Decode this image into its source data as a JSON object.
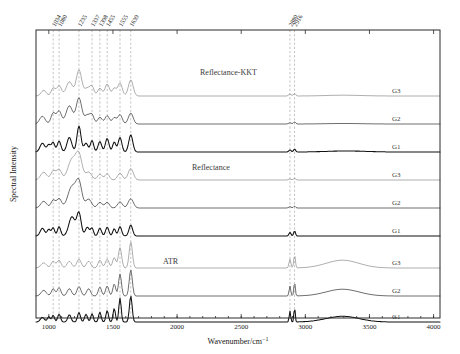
{
  "figure": {
    "width": 460,
    "height": 354,
    "background": "#ffffff"
  },
  "axes": {
    "x_title": "Wavenumber/cm",
    "x_title_exponent": "−1",
    "y_title": "Spectral Intensity",
    "x_ticks": [
      "1000",
      "1500",
      "2000",
      "2500",
      "3000",
      "3500",
      "4000"
    ],
    "x_min": 900,
    "x_max": 4050
  },
  "marker_lines": {
    "fingerprint": [
      "1034",
      "1080",
      "1235",
      "1337",
      "1398",
      "1455",
      "1555",
      "1639"
    ],
    "ch_stretch": [
      "2880",
      "2916"
    ]
  },
  "group_labels": [
    {
      "name": "Reflectance-KKT",
      "x": 200,
      "y": 75
    },
    {
      "name": "Reflectance",
      "x": 192,
      "y": 170
    },
    {
      "name": "ATR",
      "x": 163,
      "y": 264
    }
  ],
  "series_labels": [
    "G3",
    "G2",
    "G1",
    "G3",
    "G2",
    "G1",
    "G3",
    "G2",
    "G1"
  ],
  "colors": {
    "light": "#9b9b9b",
    "mid": "#5a5a5a",
    "dark": "#1a1a1a",
    "gridline": "#9a9a9a",
    "frame": "#2b2b2b"
  },
  "chart_data": {
    "type": "line",
    "title": "",
    "xlabel": "Wavenumber/cm−1",
    "ylabel": "Spectral Intensity",
    "xlim": [
      900,
      4050
    ],
    "grid": false,
    "legend": "inline-right",
    "annotations": [
      "1034",
      "1080",
      "1235",
      "1337",
      "1398",
      "1455",
      "1555",
      "1639",
      "2880",
      "2916"
    ],
    "groups": [
      {
        "name": "Reflectance-KKT",
        "series": [
          {
            "name": "G3",
            "color": "#9b9b9b",
            "baseline": 96,
            "amplitude": 1.0,
            "peaks": [
              {
                "x": 960,
                "h": 0.22,
                "w": 28
              },
              {
                "x": 1034,
                "h": 0.3,
                "w": 22
              },
              {
                "x": 1080,
                "h": 0.4,
                "w": 26
              },
              {
                "x": 1160,
                "h": 0.55,
                "w": 34
              },
              {
                "x": 1235,
                "h": 1.0,
                "w": 30
              },
              {
                "x": 1300,
                "h": 0.3,
                "w": 30
              },
              {
                "x": 1337,
                "h": 0.34,
                "w": 22
              },
              {
                "x": 1398,
                "h": 0.3,
                "w": 24
              },
              {
                "x": 1455,
                "h": 0.46,
                "w": 24
              },
              {
                "x": 1510,
                "h": 0.3,
                "w": 22
              },
              {
                "x": 1555,
                "h": 0.5,
                "w": 24
              },
              {
                "x": 1639,
                "h": 0.62,
                "w": 26
              },
              {
                "x": 2880,
                "h": 0.07,
                "w": 14
              },
              {
                "x": 2916,
                "h": 0.1,
                "w": 12
              },
              {
                "x": 3300,
                "h": 0.03,
                "w": 200
              }
            ]
          },
          {
            "name": "G2",
            "color": "#4a4a4a",
            "baseline": 124,
            "amplitude": 1.0,
            "peaks": [
              {
                "x": 950,
                "h": 0.3,
                "w": 30
              },
              {
                "x": 1034,
                "h": 0.42,
                "w": 24
              },
              {
                "x": 1080,
                "h": 0.5,
                "w": 26
              },
              {
                "x": 1160,
                "h": 0.7,
                "w": 36
              },
              {
                "x": 1235,
                "h": 1.0,
                "w": 30
              },
              {
                "x": 1300,
                "h": 0.34,
                "w": 30
              },
              {
                "x": 1337,
                "h": 0.32,
                "w": 22
              },
              {
                "x": 1398,
                "h": 0.26,
                "w": 24
              },
              {
                "x": 1455,
                "h": 0.32,
                "w": 24
              },
              {
                "x": 1510,
                "h": 0.24,
                "w": 22
              },
              {
                "x": 1555,
                "h": 0.36,
                "w": 24
              },
              {
                "x": 1639,
                "h": 0.42,
                "w": 26
              },
              {
                "x": 2880,
                "h": 0.05,
                "w": 14
              },
              {
                "x": 2916,
                "h": 0.08,
                "w": 12
              },
              {
                "x": 3300,
                "h": 0.02,
                "w": 200
              }
            ]
          },
          {
            "name": "G1",
            "color": "#111111",
            "baseline": 152,
            "amplitude": 1.0,
            "peaks": [
              {
                "x": 950,
                "h": 0.34,
                "w": 26
              },
              {
                "x": 1000,
                "h": 0.28,
                "w": 20
              },
              {
                "x": 1034,
                "h": 0.36,
                "w": 18
              },
              {
                "x": 1080,
                "h": 0.42,
                "w": 20
              },
              {
                "x": 1160,
                "h": 0.56,
                "w": 26
              },
              {
                "x": 1235,
                "h": 1.0,
                "w": 22
              },
              {
                "x": 1290,
                "h": 0.34,
                "w": 22
              },
              {
                "x": 1337,
                "h": 0.44,
                "w": 18
              },
              {
                "x": 1398,
                "h": 0.4,
                "w": 20
              },
              {
                "x": 1455,
                "h": 0.52,
                "w": 20
              },
              {
                "x": 1510,
                "h": 0.38,
                "w": 18
              },
              {
                "x": 1555,
                "h": 0.56,
                "w": 20
              },
              {
                "x": 1639,
                "h": 0.66,
                "w": 22
              },
              {
                "x": 2880,
                "h": 0.08,
                "w": 12
              },
              {
                "x": 2916,
                "h": 0.11,
                "w": 11
              },
              {
                "x": 3320,
                "h": 0.04,
                "w": 220
              }
            ]
          }
        ]
      },
      {
        "name": "Reflectance",
        "series": [
          {
            "name": "G3",
            "color": "#9b9b9b",
            "baseline": 180,
            "amplitude": 1.0,
            "peaks": [
              {
                "x": 960,
                "h": 0.3,
                "w": 34
              },
              {
                "x": 1034,
                "h": 0.34,
                "w": 26
              },
              {
                "x": 1080,
                "h": 0.4,
                "w": 28
              },
              {
                "x": 1180,
                "h": 0.78,
                "w": 44
              },
              {
                "x": 1235,
                "h": 0.92,
                "w": 34
              },
              {
                "x": 1310,
                "h": 0.3,
                "w": 34
              },
              {
                "x": 1398,
                "h": 0.22,
                "w": 26
              },
              {
                "x": 1455,
                "h": 0.24,
                "w": 24
              },
              {
                "x": 1555,
                "h": 0.26,
                "w": 26
              },
              {
                "x": 1639,
                "h": 0.44,
                "w": 28
              },
              {
                "x": 2880,
                "h": 0.04,
                "w": 14
              },
              {
                "x": 2916,
                "h": 0.06,
                "w": 12
              }
            ]
          },
          {
            "name": "G2",
            "color": "#4a4a4a",
            "baseline": 208,
            "amplitude": 1.0,
            "peaks": [
              {
                "x": 960,
                "h": 0.26,
                "w": 32
              },
              {
                "x": 1034,
                "h": 0.3,
                "w": 24
              },
              {
                "x": 1080,
                "h": 0.36,
                "w": 26
              },
              {
                "x": 1180,
                "h": 0.82,
                "w": 44
              },
              {
                "x": 1235,
                "h": 0.94,
                "w": 32
              },
              {
                "x": 1310,
                "h": 0.34,
                "w": 32
              },
              {
                "x": 1398,
                "h": 0.22,
                "w": 26
              },
              {
                "x": 1455,
                "h": 0.22,
                "w": 24
              },
              {
                "x": 1555,
                "h": 0.24,
                "w": 26
              },
              {
                "x": 1639,
                "h": 0.36,
                "w": 28
              },
              {
                "x": 2880,
                "h": 0.05,
                "w": 13
              },
              {
                "x": 2916,
                "h": 0.07,
                "w": 11
              }
            ]
          },
          {
            "name": "G1",
            "color": "#111111",
            "baseline": 236,
            "amplitude": 1.0,
            "peaks": [
              {
                "x": 950,
                "h": 0.3,
                "w": 24
              },
              {
                "x": 1000,
                "h": 0.26,
                "w": 18
              },
              {
                "x": 1034,
                "h": 0.32,
                "w": 16
              },
              {
                "x": 1080,
                "h": 0.36,
                "w": 18
              },
              {
                "x": 1180,
                "h": 0.74,
                "w": 34
              },
              {
                "x": 1235,
                "h": 0.88,
                "w": 24
              },
              {
                "x": 1300,
                "h": 0.34,
                "w": 22
              },
              {
                "x": 1337,
                "h": 0.3,
                "w": 16
              },
              {
                "x": 1398,
                "h": 0.3,
                "w": 18
              },
              {
                "x": 1455,
                "h": 0.34,
                "w": 18
              },
              {
                "x": 1510,
                "h": 0.28,
                "w": 16
              },
              {
                "x": 1555,
                "h": 0.36,
                "w": 18
              },
              {
                "x": 1639,
                "h": 0.42,
                "w": 20
              },
              {
                "x": 2880,
                "h": 0.14,
                "w": 11
              },
              {
                "x": 2916,
                "h": 0.2,
                "w": 10
              }
            ]
          }
        ]
      },
      {
        "name": "ATR",
        "series": [
          {
            "name": "G3",
            "color": "#9b9b9b",
            "baseline": 268,
            "amplitude": 1.0,
            "peaks": [
              {
                "x": 960,
                "h": 0.2,
                "w": 30
              },
              {
                "x": 1034,
                "h": 0.26,
                "w": 22
              },
              {
                "x": 1080,
                "h": 0.3,
                "w": 22
              },
              {
                "x": 1160,
                "h": 0.26,
                "w": 26
              },
              {
                "x": 1235,
                "h": 0.34,
                "w": 24
              },
              {
                "x": 1310,
                "h": 0.26,
                "w": 24
              },
              {
                "x": 1398,
                "h": 0.3,
                "w": 20
              },
              {
                "x": 1455,
                "h": 0.34,
                "w": 20
              },
              {
                "x": 1510,
                "h": 0.4,
                "w": 18
              },
              {
                "x": 1555,
                "h": 0.78,
                "w": 18
              },
              {
                "x": 1639,
                "h": 1.0,
                "w": 18
              },
              {
                "x": 2880,
                "h": 0.34,
                "w": 10
              },
              {
                "x": 2916,
                "h": 0.5,
                "w": 9
              },
              {
                "x": 3290,
                "h": 0.3,
                "w": 180
              }
            ]
          },
          {
            "name": "G2",
            "color": "#4a4a4a",
            "baseline": 296,
            "amplitude": 1.0,
            "peaks": [
              {
                "x": 960,
                "h": 0.22,
                "w": 28
              },
              {
                "x": 1034,
                "h": 0.28,
                "w": 20
              },
              {
                "x": 1080,
                "h": 0.32,
                "w": 20
              },
              {
                "x": 1160,
                "h": 0.28,
                "w": 24
              },
              {
                "x": 1235,
                "h": 0.36,
                "w": 22
              },
              {
                "x": 1310,
                "h": 0.28,
                "w": 22
              },
              {
                "x": 1398,
                "h": 0.34,
                "w": 18
              },
              {
                "x": 1455,
                "h": 0.38,
                "w": 18
              },
              {
                "x": 1510,
                "h": 0.46,
                "w": 16
              },
              {
                "x": 1555,
                "h": 0.84,
                "w": 16
              },
              {
                "x": 1639,
                "h": 1.0,
                "w": 17
              },
              {
                "x": 2880,
                "h": 0.38,
                "w": 9
              },
              {
                "x": 2916,
                "h": 0.54,
                "w": 8
              },
              {
                "x": 3290,
                "h": 0.26,
                "w": 180
              }
            ]
          },
          {
            "name": "G1",
            "color": "#111111",
            "baseline": 322,
            "amplitude": 1.0,
            "peaks": [
              {
                "x": 950,
                "h": 0.18,
                "w": 22
              },
              {
                "x": 1000,
                "h": 0.2,
                "w": 16
              },
              {
                "x": 1034,
                "h": 0.26,
                "w": 14
              },
              {
                "x": 1080,
                "h": 0.3,
                "w": 16
              },
              {
                "x": 1160,
                "h": 0.28,
                "w": 18
              },
              {
                "x": 1235,
                "h": 0.36,
                "w": 16
              },
              {
                "x": 1290,
                "h": 0.3,
                "w": 16
              },
              {
                "x": 1337,
                "h": 0.32,
                "w": 14
              },
              {
                "x": 1398,
                "h": 0.38,
                "w": 14
              },
              {
                "x": 1455,
                "h": 0.44,
                "w": 14
              },
              {
                "x": 1510,
                "h": 0.52,
                "w": 13
              },
              {
                "x": 1555,
                "h": 0.92,
                "w": 13
              },
              {
                "x": 1639,
                "h": 1.0,
                "w": 15
              },
              {
                "x": 2880,
                "h": 0.42,
                "w": 8
              },
              {
                "x": 2916,
                "h": 0.58,
                "w": 7
              },
              {
                "x": 3290,
                "h": 0.22,
                "w": 180
              }
            ]
          }
        ]
      }
    ]
  }
}
